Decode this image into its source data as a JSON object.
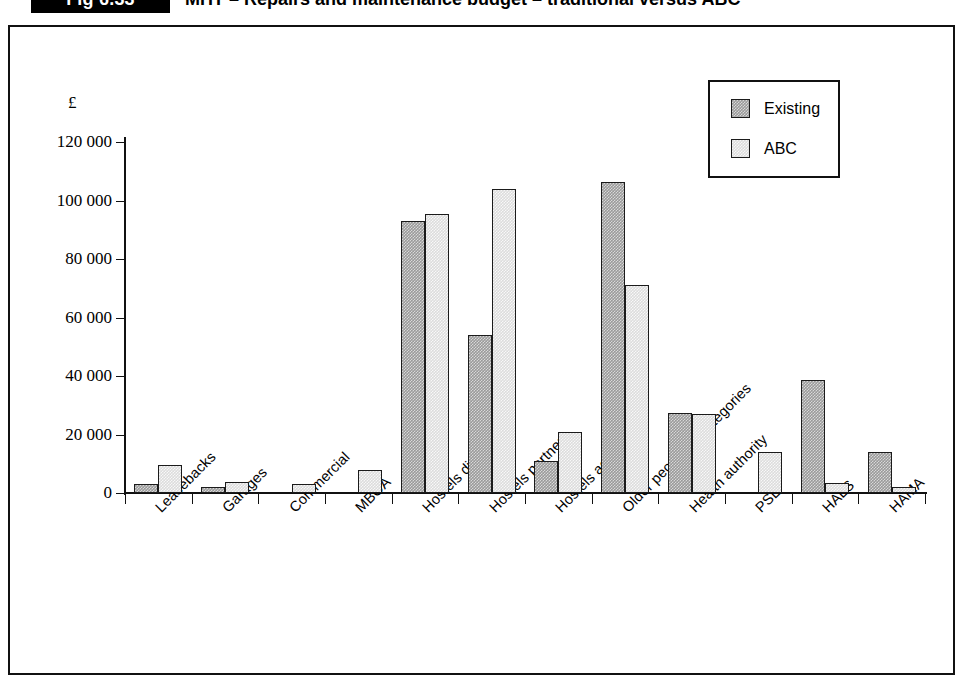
{
  "figure": {
    "badge": "Fig 6.33",
    "title": "MHT – Repairs and maintenance budget – traditional versus ABC"
  },
  "chart_data": {
    "type": "bar",
    "title": "MHT – Repairs and maintenance budget – traditional versus ABC",
    "xlabel": "",
    "ylabel": "£",
    "ylim": [
      0,
      120000
    ],
    "ytick_labels": [
      "0",
      "20 000",
      "40 000",
      "60 000",
      "80 000",
      "100 000",
      "120 000"
    ],
    "ytick_values": [
      0,
      20000,
      40000,
      60000,
      80000,
      100000,
      120000
    ],
    "grid": false,
    "legend_position": "top-right",
    "categories": [
      "Leasebacks",
      "Garages",
      "Commercial",
      "MBOA",
      "Hostels direct",
      "Hostels partner",
      "Hostels agent",
      "Older people all categories",
      "Health authority",
      "PSL",
      "HALS",
      "HAMA"
    ],
    "series": [
      {
        "name": "Existing",
        "color": "#9a9a9a",
        "values": [
          3000,
          2000,
          0,
          0,
          93000,
          54000,
          11000,
          106500,
          27500,
          0,
          38500,
          14000
        ]
      },
      {
        "name": "ABC",
        "color": "#dcdcdc",
        "values": [
          9500,
          3800,
          3000,
          8000,
          95500,
          104000,
          21000,
          71000,
          27000,
          14000,
          3500,
          2000
        ]
      }
    ]
  },
  "legend": {
    "items": [
      {
        "label": "Existing"
      },
      {
        "label": "ABC"
      }
    ]
  }
}
